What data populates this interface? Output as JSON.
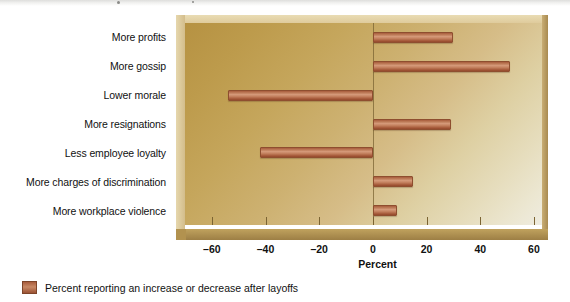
{
  "figure": {
    "legend_label": "Percent reporting an increase or decrease after layoffs",
    "legend_swatch_name": "legend-color-swatch",
    "colors": {
      "bar": "#b5714e",
      "bar_edge": "#8e4e2f",
      "plot_bg_dark": "#b69242",
      "plot_bg_light": "#efece0",
      "frame": "#c0a25e",
      "axis_line": "#7b6433",
      "text": "#111111"
    }
  },
  "chart_data": {
    "type": "bar",
    "orientation": "horizontal",
    "title": "",
    "xlabel": "Percent",
    "ylabel": "",
    "xlim": [
      -70,
      63
    ],
    "xticks": [
      -60,
      -40,
      -20,
      0,
      20,
      40,
      60
    ],
    "xticklabels": [
      "–60",
      "–40",
      "–20",
      "0",
      "20",
      "40",
      "60"
    ],
    "grid": false,
    "legend": [
      {
        "label": "Percent reporting an increase or decrease after layoffs",
        "color": "#b5714e"
      }
    ],
    "legend_position": "below-left",
    "categories": [
      "More profits",
      "More gossip",
      "Lower morale",
      "More resignations",
      "Less employee loyalty",
      "More charges of discrimination",
      "More workplace violence"
    ],
    "values": [
      30,
      51,
      -54,
      29,
      -42,
      15,
      9
    ],
    "series": [
      {
        "name": "Percent reporting an increase or decrease after layoffs",
        "values": [
          30,
          51,
          -54,
          29,
          -42,
          15,
          9
        ]
      }
    ]
  }
}
